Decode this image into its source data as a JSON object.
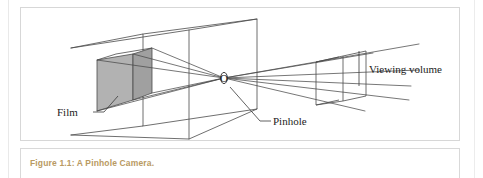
{
  "figure": {
    "caption": "Figure 1.1: A Pinhole Camera.",
    "caption_color": "#b99a63",
    "frame_color": "#d7d7d7",
    "background": "#ffffff"
  },
  "diagram": {
    "line_color": "#4a4a4a",
    "film_fill": "#b0b0b0",
    "film_side_fill": "#9c9c9c",
    "labels": {
      "film": "Film",
      "pinhole": "Pinhole",
      "viewing_volume": "Viewing volume",
      "pinhole_marker": "O"
    }
  }
}
